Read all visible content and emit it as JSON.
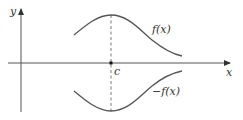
{
  "diagram": {
    "axes": {
      "x_label": "x",
      "y_label": "y"
    },
    "point": {
      "label": "c"
    },
    "curves": [
      {
        "name": "f",
        "label": "f(x)"
      },
      {
        "name": "neg-f",
        "label": "−f(x)"
      }
    ],
    "colors": {
      "stroke": "#555555",
      "text": "#333333",
      "background": "#ffffff"
    }
  }
}
